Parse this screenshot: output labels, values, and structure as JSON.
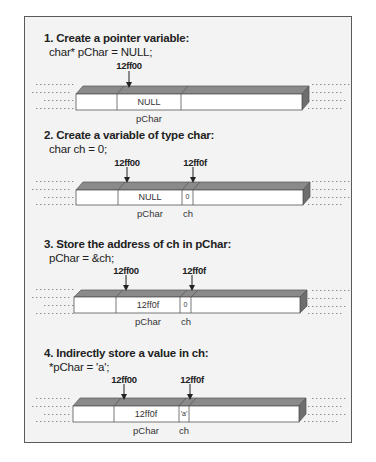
{
  "steps": [
    {
      "title": "1. Create a pointer variable:",
      "code": "char* pChar = NULL;",
      "addresses": [
        "12ff00"
      ],
      "cells": {
        "pChar": "NULL"
      },
      "labels": [
        "pChar"
      ]
    },
    {
      "title": "2. Create a variable of type char:",
      "code": "char ch = 0;",
      "addresses": [
        "12ff00",
        "12ff0f"
      ],
      "cells": {
        "pChar": "NULL",
        "ch": "0"
      },
      "labels": [
        "pChar",
        "ch"
      ]
    },
    {
      "title": "3. Store the address of ch in pChar:",
      "code": "pChar = &ch;",
      "addresses": [
        "12ff00",
        "12ff0f"
      ],
      "cells": {
        "pChar": "12ff0f",
        "ch": "0"
      },
      "labels": [
        "pChar",
        "ch"
      ]
    },
    {
      "title": "4. Indirectly store a value in ch:",
      "code": "*pChar = 'a';",
      "addresses": [
        "12ff00",
        "12ff0f"
      ],
      "cells": {
        "pChar": "12ff0f",
        "ch": "'a'"
      },
      "labels": [
        "pChar",
        "ch"
      ]
    }
  ],
  "colors": {
    "panel_bg": "#f3f3f3",
    "bar_top": "#8a8a8a",
    "bar_side": "#6e6e6e",
    "bar_front": "#ffffff",
    "border": "#5a5a5a"
  }
}
